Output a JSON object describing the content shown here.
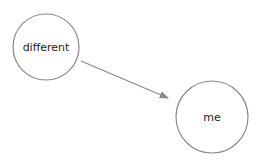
{
  "nodes": [
    {
      "id": "n1",
      "label": "different",
      "cx": 46,
      "cy": 47,
      "r": 33
    },
    {
      "id": "n2",
      "label": "me",
      "cx": 212,
      "cy": 117,
      "r": 36
    }
  ],
  "edges": [
    {
      "from": "n1",
      "to": "n2",
      "x1": 81,
      "y1": 61,
      "x2": 168,
      "y2": 98
    }
  ],
  "colors": {
    "stroke": "#8a8a8a",
    "text": "#222222",
    "background": "#ffffff"
  }
}
